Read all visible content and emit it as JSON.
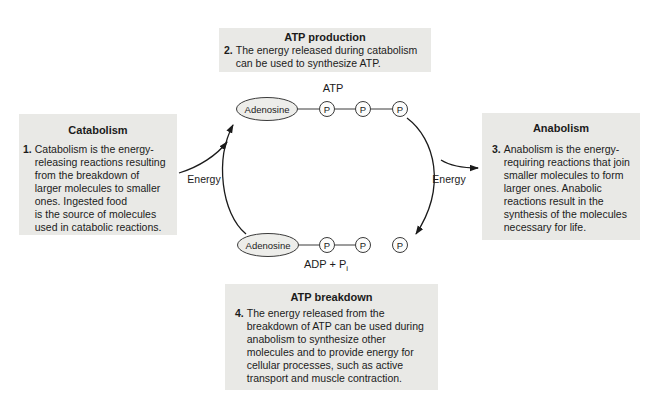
{
  "colors": {
    "box_bg": "#e9e9e6",
    "line": "#2e2e2e",
    "ellipse_fill": "#ededea",
    "circle_fill": "#fcfcfb",
    "text": "#1b1b1b"
  },
  "boxes": {
    "atp_production": {
      "title": "ATP production",
      "number": "2.",
      "text": "The energy released during catabolism\ncan be used to synthesize ATP."
    },
    "catabolism": {
      "title": "Catabolism",
      "number": "1.",
      "text": "Catabolism is the energy-\nreleasing reactions resulting\nfrom the breakdown of\nlarger molecules to smaller\nones. Ingested food\nis the source of molecules\nused in catabolic reactions."
    },
    "anabolism": {
      "title": "Anabolism",
      "number": "3.",
      "text": "Anabolism is the energy-\nrequiring reactions that join\nsmaller molecules to form\nlarger ones. Anabolic\nreactions result in the\nsynthesis of the molecules\nnecessary for life."
    },
    "atp_breakdown": {
      "title": "ATP breakdown",
      "number": "4.",
      "text": "The energy released from the\nbreakdown of ATP can be used during\nanabolism to synthesize other\nmolecules and to provide energy for\ncellular processes, such as active\ntransport and muscle contraction."
    }
  },
  "cycle": {
    "atp_label": "ATP",
    "adenosine_top": "Adenosine",
    "adenosine_bottom": "Adenosine",
    "atp_phosphates": [
      "P",
      "P",
      "P"
    ],
    "adp_phosphates": [
      "P",
      "P"
    ],
    "free_phosphate": "P",
    "adp_label_main": "ADP + P",
    "adp_label_sub": "i",
    "energy_left": "Energy",
    "energy_right": "Energy"
  }
}
